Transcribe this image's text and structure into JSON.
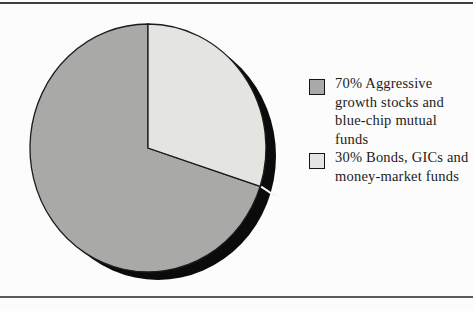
{
  "page": {
    "background": "#fcfcfc",
    "top_rule_color": "#3e3e3e",
    "bottom_rule_color": "#5a5a5a"
  },
  "chart_data": {
    "type": "pie",
    "title": "",
    "slices": [
      {
        "label": "Aggressive growth stocks and blue-chip mutual funds",
        "value": 70,
        "color": "#a9a9a7"
      },
      {
        "label": "Bonds, GICs and money-market funds",
        "value": 30,
        "color": "#e4e4e1"
      }
    ],
    "start_angle_deg": 108,
    "direction": "clockwise",
    "outline_color": "#1c1c1c",
    "shadow_color": "#0b0b0b",
    "slice_divider_color": "#f5f5f3",
    "text_color": "#1b1b1b",
    "swatch_border_color": "#141414",
    "legend_position": "right",
    "legend": [
      {
        "lines": "70% Aggressive\ngrowth stocks and\nblue-chip mutual\nfunds",
        "swatch_color": "#a9a9a7"
      },
      {
        "lines": "30% Bonds, GICs and\nmoney-market funds",
        "swatch_color": "#e4e4e1"
      }
    ]
  }
}
